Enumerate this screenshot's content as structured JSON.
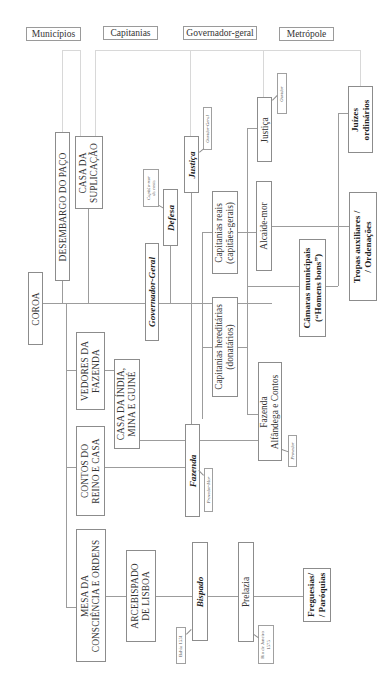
{
  "headers": {
    "municipios": "Municípios",
    "capitanias": "Capitanias",
    "governador_geral": "Governador-geral",
    "metropole": "Metrópole"
  },
  "nodes": {
    "coroa": "COROA",
    "desembargo": "DESEMBARGO DO PAÇO",
    "casa_suplicacao": [
      "CASA DA",
      "SUPLICAÇÃO"
    ],
    "governador_geral": "Governador-Geral",
    "capitao_mor": [
      "Capitão-mor",
      "da costa"
    ],
    "defesa": "Defesa",
    "justica_gg": "Justiça",
    "ouvidor_geral": "Ouvidor-Geral",
    "capitanias_reais": [
      "Capitanias reais",
      "(capitães-gerais)"
    ],
    "capitanias_hereditarias": [
      "Capitanias hereditárias",
      "(donatários)"
    ],
    "justica_cap": "Justiça",
    "ouvidor": "Ouvidor",
    "alcaide_mor": "Alcaide-mor",
    "camaras": [
      "Câmaras municipais",
      "(“Homens bons”)"
    ],
    "juizes": [
      "Juízes",
      "ordinários"
    ],
    "tropas": [
      "Tropas auxiliares /",
      "/ Ordenações"
    ],
    "fazenda_cap": [
      "Fazenda",
      "Alfândega e Contos"
    ],
    "provedor": "Provedor",
    "vedores": [
      "VEDORES DA",
      "FAZENDA"
    ],
    "casa_india": [
      "CASA DA ÍNDIA,",
      "MINA E GUINÉ"
    ],
    "fazenda_gg": "Fazenda",
    "provedor_mor": "Provedor-Mor",
    "contos": [
      "CONTOS DO",
      "REINO E CASA"
    ],
    "mesa": [
      "MESA DA",
      "CONSCIÊNCIA E ORDENS"
    ],
    "arcebispado": [
      "ARCEBISPADO",
      "DE LISBOA"
    ],
    "bispado": "Bispado",
    "bahia": "Bahia 1551",
    "prelazia": "Prelazia",
    "rio": [
      "Rio de Janeiro",
      "1575"
    ],
    "freguesias": [
      "Freguesias/",
      "/ Paróquias"
    ]
  }
}
